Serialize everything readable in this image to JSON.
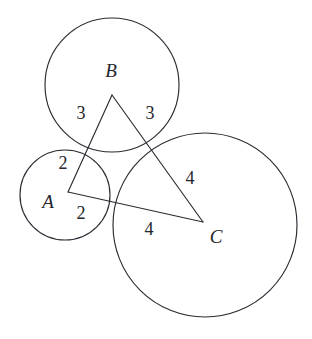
{
  "figure": {
    "kind": "geometry-diagram",
    "canvas": {
      "width": 312,
      "height": 339
    },
    "colors": {
      "background": "#ffffff",
      "stroke": "#2b2b33",
      "text": "#25252c"
    },
    "circles": [
      {
        "name": "circle-a",
        "cx": 65,
        "cy": 195,
        "r": 45
      },
      {
        "name": "circle-b",
        "cx": 112,
        "cy": 85,
        "r": 67
      },
      {
        "name": "circle-c",
        "cx": 205,
        "cy": 225,
        "r": 92
      }
    ],
    "vertices": [
      {
        "name": "vertex-a",
        "label": "A",
        "x": 68,
        "y": 192,
        "label_x": 48,
        "label_y": 201
      },
      {
        "name": "vertex-b",
        "label": "B",
        "x": 112,
        "y": 95,
        "label_x": 111,
        "label_y": 70
      },
      {
        "name": "vertex-c",
        "label": "C",
        "x": 203,
        "y": 222,
        "label_x": 216,
        "label_y": 236
      }
    ],
    "sides": [
      {
        "name": "side-ab",
        "from": "A",
        "to": "B"
      },
      {
        "name": "side-bc",
        "from": "B",
        "to": "C"
      },
      {
        "name": "side-ca",
        "from": "C",
        "to": "A"
      }
    ],
    "segment_labels": [
      {
        "name": "length-ba",
        "text": "3",
        "x": 81,
        "y": 113,
        "side": "AB",
        "near": "B"
      },
      {
        "name": "length-bc",
        "text": "3",
        "x": 150,
        "y": 113,
        "side": "BC",
        "near": "B"
      },
      {
        "name": "length-ab",
        "text": "2",
        "x": 63,
        "y": 163,
        "side": "AB",
        "near": "A"
      },
      {
        "name": "length-ac",
        "text": "2",
        "x": 81,
        "y": 213,
        "side": "CA",
        "near": "A"
      },
      {
        "name": "length-cb",
        "text": "4",
        "x": 190,
        "y": 178,
        "side": "BC",
        "near": "C"
      },
      {
        "name": "length-ca",
        "text": "4",
        "x": 149,
        "y": 229,
        "side": "CA",
        "near": "C"
      }
    ],
    "chart_data": {
      "type": "scatter",
      "title": "",
      "xlabel": "",
      "ylabel": "",
      "series": [
        {
          "name": "circle-centers",
          "points": [
            {
              "label": "A",
              "x": 68,
              "y": 192,
              "radius": 45
            },
            {
              "label": "B",
              "x": 112,
              "y": 95,
              "radius": 67
            },
            {
              "label": "C",
              "x": 203,
              "y": 222,
              "radius": 92
            }
          ]
        }
      ],
      "annotations": [
        "3",
        "3",
        "2",
        "2",
        "4",
        "4"
      ]
    }
  }
}
